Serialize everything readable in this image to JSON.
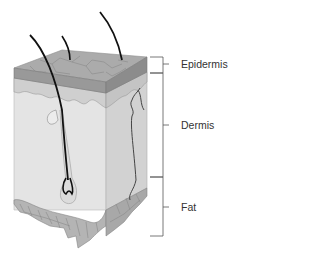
{
  "diagram": {
    "layers": [
      {
        "name": "Epidermis",
        "label_y": 64
      },
      {
        "name": "Dermis",
        "label_y": 125
      },
      {
        "name": "Fat",
        "label_y": 207
      }
    ],
    "structures": [
      "hair shafts",
      "hair follicle",
      "sebaceous gland",
      "blood vessel"
    ],
    "colors": {
      "epidermis_top": "#a9a9a9",
      "epidermis_side": "#9a9a9a",
      "dermis_top": "#d4d4d4",
      "dermis_front": "#e2e2e2",
      "dermis_side": "#d0d0d0",
      "fat": "#b5b5b5",
      "fat_lines": "#8a8a8a",
      "hair": "#111111",
      "bracket": "#555555",
      "label_text": "#333333"
    }
  }
}
